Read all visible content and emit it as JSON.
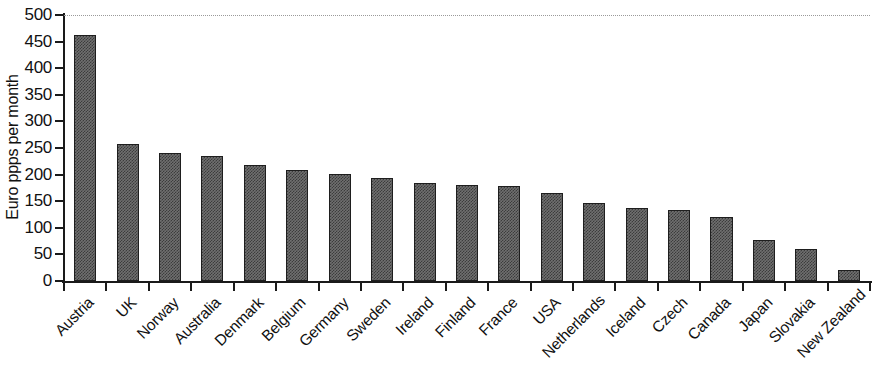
{
  "chart_data": {
    "type": "bar",
    "title": "",
    "subtitle": "",
    "xlabel": "",
    "ylabel": "Euro ppps per month",
    "ylim": [
      0,
      500
    ],
    "yticks": [
      0,
      50,
      100,
      150,
      200,
      250,
      300,
      350,
      400,
      450,
      500
    ],
    "ytick_labels": [
      "0",
      "50",
      "100",
      "150",
      "200",
      "250",
      "300",
      "350",
      "400",
      "450",
      "500"
    ],
    "grid": "top-dotted-only",
    "legend": "none",
    "bar_color": "#6f6f6f",
    "bar_edge_color": "#1e1e1e",
    "axis_color": "#1a1a1a",
    "categories": [
      "Austria",
      "UK",
      "Norway",
      "Australia",
      "Denmark",
      "Belgium",
      "Germany",
      "Sweden",
      "Ireland",
      "Finland",
      "France",
      "USA",
      "Netherlands",
      "Iceland",
      "Czech",
      "Canada",
      "Japan",
      "Slovakia",
      "New Zealand"
    ],
    "values": [
      463,
      258,
      241,
      235,
      218,
      209,
      202,
      193,
      184,
      181,
      178,
      165,
      147,
      137,
      133,
      121,
      77,
      60,
      21
    ]
  }
}
